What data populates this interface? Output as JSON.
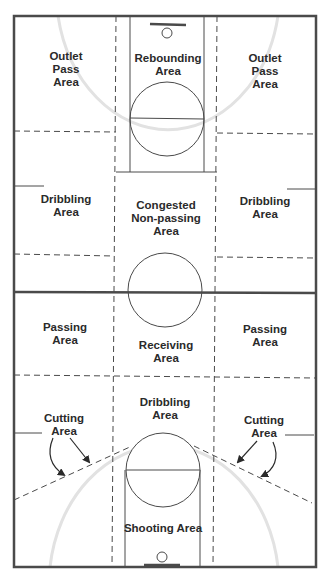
{
  "colors": {
    "line": "#4a4a4a",
    "faint_arc": "#e2e2e2",
    "text": "#2a2a2a",
    "background": "#ffffff"
  },
  "labels": {
    "top_left": [
      "Outlet",
      "Pass",
      "Area"
    ],
    "top_center": [
      "Rebounding",
      "Area"
    ],
    "top_right": [
      "Outlet",
      "Pass",
      "Area"
    ],
    "mid_left": [
      "Dribbling",
      "Area"
    ],
    "mid_center": [
      "Congested",
      "Non-passing",
      "Area"
    ],
    "mid_right": [
      "Dribbling",
      "Area"
    ],
    "lower_left": [
      "Passing",
      "Area"
    ],
    "lower_center": [
      "Receiving",
      "Area"
    ],
    "lower_right": [
      "Passing",
      "Area"
    ],
    "bottom_center_upper": [
      "Dribbling",
      "Area"
    ],
    "bottom_left": [
      "Cutting",
      "Area"
    ],
    "bottom_right": [
      "Cutting",
      "Area"
    ],
    "bottom_lane": [
      "Shooting Area"
    ]
  }
}
